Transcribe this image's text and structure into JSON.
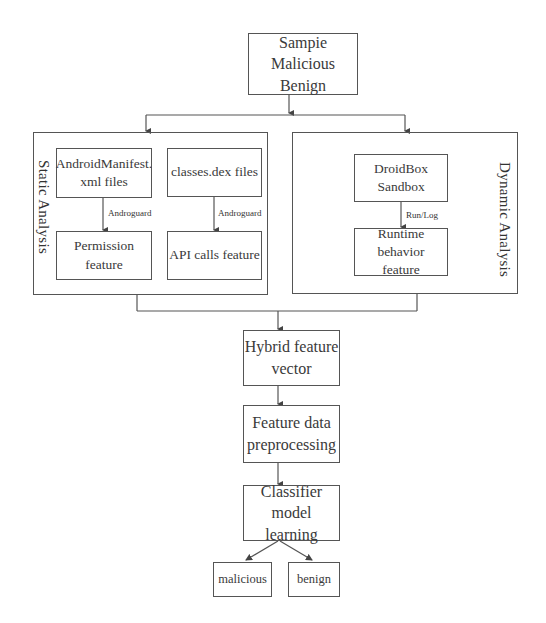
{
  "diagram": {
    "source": {
      "lines": [
        "Sampie",
        "Malicious",
        "Benign"
      ]
    },
    "static_analysis": {
      "label": "Static Analysis",
      "manifest": {
        "lines": [
          "AndroidManifest.",
          "xml files"
        ]
      },
      "classes": {
        "lines": [
          "classes.dex files"
        ]
      },
      "permission": {
        "lines": [
          "Permission",
          "feature"
        ]
      },
      "api": {
        "lines": [
          "API calls feature"
        ]
      },
      "edge_manifest_permission": "Androguard",
      "edge_classes_api": "Androguard"
    },
    "dynamic_analysis": {
      "label": "Dynamic Analysis",
      "droidbox": {
        "lines": [
          "DroidBox",
          "Sandbox"
        ]
      },
      "runtime": {
        "lines": [
          "Runtime behavior",
          "feature"
        ]
      },
      "edge_droidbox_runtime": "Run/Log"
    },
    "hybrid": {
      "lines": [
        "Hybrid feature",
        "vector"
      ]
    },
    "preprocessing": {
      "lines": [
        "Feature data",
        "preprocessing"
      ]
    },
    "classifier": {
      "lines": [
        "Classifier model",
        "learning"
      ]
    },
    "outputs": [
      {
        "label": "malicious"
      },
      {
        "label": "benign"
      }
    ],
    "colors": {
      "stroke": "#555555",
      "text": "#3a3a3a",
      "background": "#ffffff"
    }
  }
}
